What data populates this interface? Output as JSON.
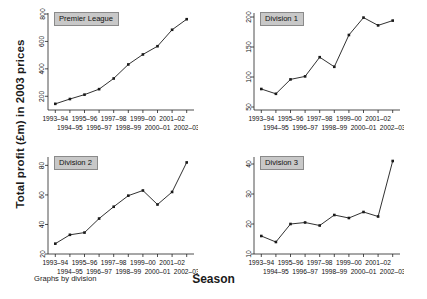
{
  "figure": {
    "ylabel": "Total profit (£m) in 2003 prices",
    "xlabel": "Season",
    "note": "Graphs by division"
  },
  "chart_data": {
    "type": "line",
    "title": "",
    "xlabel": "Season",
    "ylabel": "Total profit (£m) in 2003 prices",
    "note": "Graphs by division",
    "layout": "2x2 small multiples",
    "grid": false,
    "legend": false,
    "marker": "filled-square",
    "categories": [
      "1993-94",
      "1994-95",
      "1995-96",
      "1996-97",
      "1997-98",
      "1998-99",
      "1999-00",
      "2000-01",
      "2001-02",
      "2002-03"
    ],
    "panels": [
      {
        "name": "Premier League",
        "ylim": [
          100,
          800
        ],
        "yticks": [
          200,
          400,
          600,
          800
        ],
        "values": [
          145,
          180,
          212,
          252,
          330,
          432,
          505,
          565,
          685,
          762
        ]
      },
      {
        "name": "Division 1",
        "ylim": [
          45,
          205
        ],
        "yticks": [
          50,
          100,
          150,
          200
        ],
        "values": [
          80,
          72,
          96,
          101,
          133,
          117,
          170,
          199,
          186,
          194
        ]
      },
      {
        "name": "Division 2",
        "ylim": [
          20,
          85
        ],
        "yticks": [
          20,
          40,
          60,
          80
        ],
        "values": [
          27,
          33,
          34.5,
          44,
          52,
          59.5,
          63,
          53.5,
          62,
          82
        ]
      },
      {
        "name": "Division 3",
        "ylim": [
          10,
          42
        ],
        "yticks": [
          10,
          20,
          30,
          40
        ],
        "values": [
          16,
          14,
          20,
          20.5,
          19.5,
          23,
          22,
          24,
          22.5,
          41
        ]
      }
    ]
  }
}
